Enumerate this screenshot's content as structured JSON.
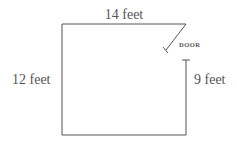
{
  "diagram": {
    "top_label": "14 feet",
    "left_label": "12 feet",
    "right_label": "9 feet",
    "door_label": "DOOR",
    "line_color": "#555555"
  }
}
